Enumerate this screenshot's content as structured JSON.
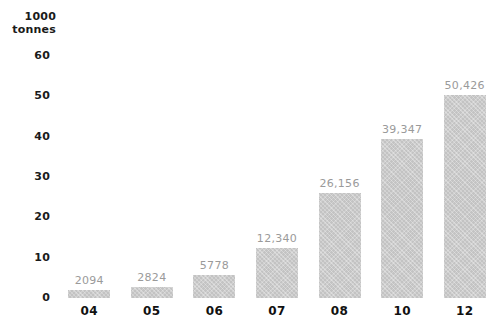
{
  "chart_data": {
    "type": "bar",
    "title": "",
    "subtitle": "",
    "xlabel": "",
    "ylabel": "1000 tonnes",
    "ylabel_lines": [
      "1000",
      "tonnes"
    ],
    "categories": [
      "04",
      "05",
      "06",
      "07",
      "08",
      "10",
      "12"
    ],
    "values": [
      2.094,
      2.824,
      5.778,
      12.34,
      26.156,
      39.347,
      50.426
    ],
    "value_labels": [
      "2094",
      "2824",
      "5778",
      "12,340",
      "26,156",
      "39,347",
      "50,426"
    ],
    "ylim": [
      0,
      60
    ],
    "yticks": [
      0,
      10,
      20,
      30,
      40,
      50,
      60
    ],
    "ytick_labels": [
      "0",
      "10",
      "20",
      "30",
      "40",
      "50",
      "60"
    ],
    "grid": false,
    "legend": null,
    "series": [
      {
        "name": "",
        "values": [
          2.094,
          2.824,
          5.778,
          12.34,
          26.156,
          39.347,
          50.426
        ]
      }
    ],
    "colors": {
      "bar": "#c3c3c3",
      "value_label": "#9a9a9a",
      "axis_text": "#111111",
      "background": "#ffffff"
    }
  }
}
